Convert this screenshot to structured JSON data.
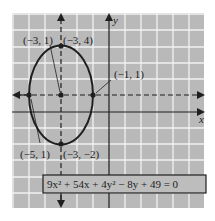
{
  "figure": {
    "equation": "9x² + 54x + 4y² − 8y + 49 = 0",
    "axis_labels": {
      "x": "x",
      "y": "y"
    },
    "points": [
      {
        "id": "focus-ref",
        "label": "(−3, 1)",
        "x": -3,
        "y": 1
      },
      {
        "id": "top-vertex",
        "label": "(−3, 4)",
        "x": -3,
        "y": 4
      },
      {
        "id": "right-covertex",
        "label": "(−1, 1)",
        "x": -1,
        "y": 1
      },
      {
        "id": "left-covertex",
        "label": "(−5, 1)",
        "x": -5,
        "y": 1
      },
      {
        "id": "bottom-vertex",
        "label": "(−3, −2)",
        "x": -3,
        "y": -2
      }
    ],
    "ellipse": {
      "center": [
        -3,
        1
      ],
      "semi_x": 2,
      "semi_y": 3
    },
    "colors": {
      "grid_bg": "#b9b9b9",
      "grid_line": "#f2f2f2",
      "ink": "#1f1f1f"
    }
  }
}
